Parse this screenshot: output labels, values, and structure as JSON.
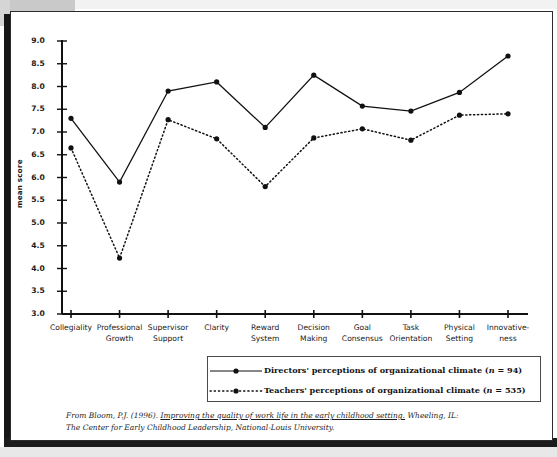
{
  "figure": {
    "y_axis_title": "mean score",
    "citation_line1_pre": "From Bloom, P.J. (1996). ",
    "citation_title": "Improving the quality of work life in the early childhood setting.",
    "citation_line1_post": " Wheeling, IL:",
    "citation_line2": "The Center for Early Childhood Leadership, National-Louis University."
  },
  "legend": {
    "items": [
      {
        "label_main": "Directors' perceptions of organizational climate (",
        "label_n": "n",
        "label_tail": " = 94)",
        "style": "solid",
        "marker": "dot-marker"
      },
      {
        "label_main": "Teachers' perceptions of organizational climate (",
        "label_n": "n",
        "label_tail": " = 535)",
        "style": "dotted",
        "marker": "dot-marker"
      }
    ]
  },
  "chart_data": {
    "type": "line",
    "title": "",
    "xlabel": "",
    "ylabel": "mean score",
    "ylim": [
      3.0,
      9.0
    ],
    "ytick_values": [
      3.0,
      3.5,
      4.0,
      4.5,
      5.0,
      5.5,
      6.0,
      6.5,
      7.0,
      7.5,
      8.0,
      8.5,
      9.0
    ],
    "ytick_labels": [
      "3.0",
      "3.5",
      "4.0",
      "4.5",
      "5.0",
      "5.5",
      "6.0",
      "6.5",
      "7.0",
      "7.5",
      "8.0",
      "8.5",
      "9.0"
    ],
    "grid": false,
    "legend_position": "below-plot",
    "categories": [
      "Collegiality",
      "Professional Growth",
      "Supervisor Support",
      "Clarity",
      "Reward System",
      "Decision Making",
      "Goal Consensus",
      "Task Orientation",
      "Physical Setting",
      "Innovativeness"
    ],
    "category_lines": [
      [
        "Collegiality",
        ""
      ],
      [
        "Professional",
        "Growth"
      ],
      [
        "Supervisor",
        "Support"
      ],
      [
        "Clarity",
        ""
      ],
      [
        "Reward",
        "System"
      ],
      [
        "Decision",
        "Making"
      ],
      [
        "Goal",
        "Consensus"
      ],
      [
        "Task",
        "Orientation"
      ],
      [
        "Physical",
        "Setting"
      ],
      [
        "Innovative-",
        "ness"
      ]
    ],
    "series": [
      {
        "name": "Directors' perceptions of organizational climate (n = 94)",
        "n": 94,
        "style": "solid",
        "color": "#111111",
        "values": [
          7.3,
          5.9,
          7.9,
          8.1,
          7.1,
          8.25,
          7.57,
          7.46,
          7.87,
          8.67
        ]
      },
      {
        "name": "Teachers' perceptions of organizational climate (n = 535)",
        "n": 535,
        "style": "dotted",
        "color": "#111111",
        "values": [
          6.65,
          4.23,
          7.27,
          6.85,
          5.8,
          6.87,
          7.07,
          6.82,
          7.37,
          7.4
        ]
      }
    ]
  }
}
